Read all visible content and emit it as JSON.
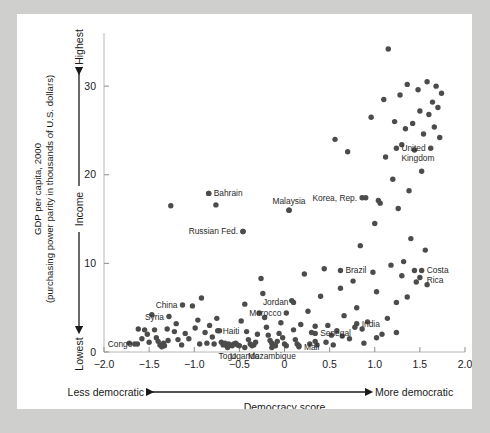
{
  "figure": {
    "background_color": "#cfcfce",
    "page_color": "#ffffff",
    "point_color": "#4c4c4b"
  },
  "axes": {
    "y_label_line1": "GDP per capita, 2000",
    "y_label_line2": "(purchasing power parity in thousands of U.S. dollars)",
    "y_arrow_label": "Income",
    "y_high_label": "Highest",
    "y_low_label": "Lowest",
    "y_ticks": [
      "0",
      "10",
      "20",
      "30"
    ],
    "y_tick_values": [
      0,
      10,
      20,
      30
    ],
    "x_ticks": [
      "−2.0",
      "−1.5",
      "−1.0",
      "−0.5",
      "0",
      "0.5",
      "1.0",
      "1.5",
      "2.0"
    ],
    "x_tick_values": [
      -2.0,
      -1.5,
      -1.0,
      -0.5,
      0,
      0.5,
      1.0,
      1.5,
      2.0
    ],
    "x_left_label": "Less democratic",
    "x_right_label": "More democratic",
    "x_title": "Democracy score"
  },
  "chart_data": {
    "type": "scatter",
    "title": "",
    "xlabel": "Democracy score",
    "ylabel": "GDP per capita, 2000 (purchasing power parity in thousands of U.S. dollars)",
    "xlim": [
      -2.0,
      2.0
    ],
    "ylim": [
      0,
      36
    ],
    "grid": false,
    "legend": null,
    "x_axis_annotations": {
      "left": "Less democratic",
      "right": "More democratic",
      "arrow": "double-headed"
    },
    "y_axis_annotations": {
      "top": "Highest",
      "bottom": "Lowest",
      "middle": "Income",
      "arrow": "double-headed"
    },
    "points": [
      {
        "x": -1.72,
        "y": 1.0
      },
      {
        "x": -1.66,
        "y": 0.9
      },
      {
        "x": -1.62,
        "y": 2.6
      },
      {
        "x": -1.58,
        "y": 1.5
      },
      {
        "x": -1.55,
        "y": 2.5
      },
      {
        "x": -1.52,
        "y": 2.0
      },
      {
        "x": -1.5,
        "y": 1.1
      },
      {
        "x": -1.47,
        "y": 4.2
      },
      {
        "x": -1.44,
        "y": 2.5
      },
      {
        "x": -1.42,
        "y": 1.6
      },
      {
        "x": -1.4,
        "y": 1.2
      },
      {
        "x": -1.38,
        "y": 0.8
      },
      {
        "x": -1.36,
        "y": 0.6
      },
      {
        "x": -1.34,
        "y": 1.0
      },
      {
        "x": -1.33,
        "y": 0.7
      },
      {
        "x": -1.3,
        "y": 2.6
      },
      {
        "x": -1.29,
        "y": 1.3
      },
      {
        "x": -1.26,
        "y": 16.5
      },
      {
        "x": -1.22,
        "y": 2.3
      },
      {
        "x": -1.2,
        "y": 3.2
      },
      {
        "x": -1.18,
        "y": 1.4
      },
      {
        "x": -1.14,
        "y": 0.8
      },
      {
        "x": -1.1,
        "y": 2.1
      },
      {
        "x": -1.06,
        "y": 1.5
      },
      {
        "x": -1.02,
        "y": 5.2
      },
      {
        "x": -0.99,
        "y": 2.7
      },
      {
        "x": -0.96,
        "y": 3.6
      },
      {
        "x": -0.94,
        "y": 0.9
      },
      {
        "x": -0.92,
        "y": 6.1
      },
      {
        "x": -0.88,
        "y": 2.2
      },
      {
        "x": -0.86,
        "y": 1.0
      },
      {
        "x": -0.84,
        "y": 17.9
      },
      {
        "x": -0.83,
        "y": 3.0
      },
      {
        "x": -0.8,
        "y": 1.7
      },
      {
        "x": -0.78,
        "y": 0.9
      },
      {
        "x": -0.76,
        "y": 16.6
      },
      {
        "x": -0.75,
        "y": 3.8
      },
      {
        "x": -0.72,
        "y": 2.4
      },
      {
        "x": -0.7,
        "y": 1.1
      },
      {
        "x": -0.68,
        "y": 0.8
      },
      {
        "x": -0.66,
        "y": 1.0
      },
      {
        "x": -0.64,
        "y": 0.7
      },
      {
        "x": -0.62,
        "y": 0.9
      },
      {
        "x": -0.6,
        "y": 0.8
      },
      {
        "x": -0.58,
        "y": 0.7
      },
      {
        "x": -0.56,
        "y": 0.9
      },
      {
        "x": -0.54,
        "y": 1.0
      },
      {
        "x": -0.52,
        "y": 0.8
      },
      {
        "x": -0.5,
        "y": 0.7
      },
      {
        "x": -0.48,
        "y": 3.5
      },
      {
        "x": -0.46,
        "y": 13.6
      },
      {
        "x": -0.44,
        "y": 5.4
      },
      {
        "x": -0.42,
        "y": 2.3
      },
      {
        "x": -0.4,
        "y": 1.4
      },
      {
        "x": -0.38,
        "y": 0.9
      },
      {
        "x": -0.36,
        "y": 0.7
      },
      {
        "x": -0.34,
        "y": 0.8
      },
      {
        "x": -0.32,
        "y": 1.1
      },
      {
        "x": -0.3,
        "y": 2.0
      },
      {
        "x": -0.28,
        "y": 4.4
      },
      {
        "x": -0.26,
        "y": 8.3
      },
      {
        "x": -0.24,
        "y": 6.6
      },
      {
        "x": -0.22,
        "y": 3.9
      },
      {
        "x": -0.2,
        "y": 2.8
      },
      {
        "x": -0.18,
        "y": 1.9
      },
      {
        "x": -0.16,
        "y": 1.3
      },
      {
        "x": -0.14,
        "y": 1.0
      },
      {
        "x": -0.12,
        "y": 0.8
      },
      {
        "x": -0.1,
        "y": 0.7
      },
      {
        "x": -0.08,
        "y": 1.2
      },
      {
        "x": -0.06,
        "y": 2.1
      },
      {
        "x": -0.04,
        "y": 3.3
      },
      {
        "x": -0.02,
        "y": 1.6
      },
      {
        "x": 0.0,
        "y": 0.9
      },
      {
        "x": 0.02,
        "y": 0.7
      },
      {
        "x": 0.05,
        "y": 16.0
      },
      {
        "x": 0.08,
        "y": 5.8
      },
      {
        "x": 0.1,
        "y": 2.5
      },
      {
        "x": 0.12,
        "y": 1.4
      },
      {
        "x": 0.14,
        "y": 0.9
      },
      {
        "x": 0.16,
        "y": 0.7
      },
      {
        "x": 0.18,
        "y": 3.1
      },
      {
        "x": 0.22,
        "y": 8.8
      },
      {
        "x": 0.26,
        "y": 4.6
      },
      {
        "x": 0.3,
        "y": 2.2
      },
      {
        "x": 0.34,
        "y": 1.2
      },
      {
        "x": 0.36,
        "y": 0.8
      },
      {
        "x": 0.4,
        "y": 6.3
      },
      {
        "x": 0.44,
        "y": 9.4
      },
      {
        "x": 0.48,
        "y": 3.0
      },
      {
        "x": 0.52,
        "y": 1.9
      },
      {
        "x": 0.56,
        "y": 24.0
      },
      {
        "x": 0.58,
        "y": 2.4
      },
      {
        "x": 0.62,
        "y": 7.2
      },
      {
        "x": 0.66,
        "y": 4.1
      },
      {
        "x": 0.7,
        "y": 22.6
      },
      {
        "x": 0.72,
        "y": 1.5
      },
      {
        "x": 0.76,
        "y": 8.0
      },
      {
        "x": 0.8,
        "y": 5.0
      },
      {
        "x": 0.84,
        "y": 12.0
      },
      {
        "x": 0.86,
        "y": 2.6
      },
      {
        "x": 0.9,
        "y": 17.4
      },
      {
        "x": 0.92,
        "y": 3.4
      },
      {
        "x": 0.96,
        "y": 26.5
      },
      {
        "x": 0.98,
        "y": 9.0
      },
      {
        "x": 1.0,
        "y": 14.5
      },
      {
        "x": 1.02,
        "y": 6.8
      },
      {
        "x": 1.04,
        "y": 17.1
      },
      {
        "x": 1.06,
        "y": 16.8
      },
      {
        "x": 1.08,
        "y": 2.0
      },
      {
        "x": 1.1,
        "y": 28.5
      },
      {
        "x": 1.12,
        "y": 22.0
      },
      {
        "x": 1.15,
        "y": 34.2
      },
      {
        "x": 1.18,
        "y": 9.8
      },
      {
        "x": 1.2,
        "y": 19.5
      },
      {
        "x": 1.22,
        "y": 26.0
      },
      {
        "x": 1.24,
        "y": 5.6
      },
      {
        "x": 1.26,
        "y": 16.2
      },
      {
        "x": 1.28,
        "y": 29.0
      },
      {
        "x": 1.3,
        "y": 23.4
      },
      {
        "x": 1.32,
        "y": 10.2
      },
      {
        "x": 1.34,
        "y": 25.2
      },
      {
        "x": 1.36,
        "y": 30.2
      },
      {
        "x": 1.38,
        "y": 18.2
      },
      {
        "x": 1.4,
        "y": 12.8
      },
      {
        "x": 1.42,
        "y": 25.8
      },
      {
        "x": 1.44,
        "y": 22.8
      },
      {
        "x": 1.46,
        "y": 7.9
      },
      {
        "x": 1.48,
        "y": 29.6
      },
      {
        "x": 1.5,
        "y": 27.2
      },
      {
        "x": 1.52,
        "y": 20.4
      },
      {
        "x": 1.54,
        "y": 24.6
      },
      {
        "x": 1.56,
        "y": 11.5
      },
      {
        "x": 1.58,
        "y": 30.5
      },
      {
        "x": 1.6,
        "y": 26.8
      },
      {
        "x": 1.62,
        "y": 23.0
      },
      {
        "x": 1.64,
        "y": 28.2
      },
      {
        "x": 1.66,
        "y": 25.4
      },
      {
        "x": 1.68,
        "y": 30.0
      },
      {
        "x": 1.7,
        "y": 27.6
      },
      {
        "x": 1.72,
        "y": 24.2
      },
      {
        "x": 1.74,
        "y": 29.2
      },
      {
        "x": 1.3,
        "y": 8.6
      },
      {
        "x": 1.36,
        "y": 6.2
      },
      {
        "x": 1.44,
        "y": 9.2
      },
      {
        "x": 1.5,
        "y": 8.4
      },
      {
        "x": 1.58,
        "y": 7.6
      },
      {
        "x": 0.28,
        "y": 0.9
      },
      {
        "x": 0.34,
        "y": 2.9
      },
      {
        "x": 0.46,
        "y": 1.1
      },
      {
        "x": 0.54,
        "y": 0.8
      },
      {
        "x": 0.64,
        "y": 1.8
      },
      {
        "x": 0.78,
        "y": 2.8
      },
      {
        "x": 0.88,
        "y": 1.0
      },
      {
        "x": 1.02,
        "y": 1.6
      },
      {
        "x": 1.14,
        "y": 3.8
      },
      {
        "x": 1.24,
        "y": 2.2
      }
    ],
    "labeled_points": [
      {
        "label": "Congo",
        "x": -1.63,
        "y": 0.9,
        "label_side": "left"
      },
      {
        "label": "Syria",
        "x": -1.28,
        "y": 4.0,
        "label_side": "left"
      },
      {
        "label": "China",
        "x": -1.13,
        "y": 5.3,
        "label_side": "left"
      },
      {
        "label": "Bahrain",
        "x": -0.84,
        "y": 17.9,
        "label_side": "right"
      },
      {
        "label": "Haiti",
        "x": -0.74,
        "y": 2.4,
        "label_side": "right"
      },
      {
        "label": "Togo",
        "x": -0.63,
        "y": 0.5,
        "label_side": "below"
      },
      {
        "label": "Uganda",
        "x": -0.44,
        "y": 0.5,
        "label_side": "below"
      },
      {
        "label": "Russian Fed.",
        "x": -0.46,
        "y": 13.6,
        "label_side": "left"
      },
      {
        "label": "Mozambique",
        "x": -0.14,
        "y": 0.5,
        "label_side": "below"
      },
      {
        "label": "Morocco",
        "x": 0.02,
        "y": 4.4,
        "label_side": "left"
      },
      {
        "label": "Malaysia",
        "x": 0.05,
        "y": 16.0,
        "label_side": "above"
      },
      {
        "label": "Mali",
        "x": 0.16,
        "y": 0.6,
        "label_side": "right"
      },
      {
        "label": "Jordan",
        "x": 0.1,
        "y": 5.6,
        "label_side": "left"
      },
      {
        "label": "Senegal",
        "x": 0.34,
        "y": 2.1,
        "label_side": "right"
      },
      {
        "label": "Brazil",
        "x": 0.62,
        "y": 9.2,
        "label_side": "right"
      },
      {
        "label": "India",
        "x": 0.8,
        "y": 3.2,
        "label_side": "right"
      },
      {
        "label": "Korea, Rep.",
        "x": 0.86,
        "y": 17.4,
        "label_side": "left"
      },
      {
        "label": "Costa Rica",
        "x": 1.52,
        "y": 9.2,
        "label_side": "right"
      },
      {
        "label": "United Kingdom",
        "x": 1.24,
        "y": 23.0,
        "label_side": "right"
      }
    ]
  }
}
